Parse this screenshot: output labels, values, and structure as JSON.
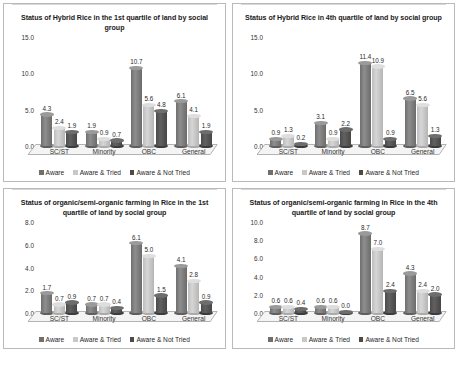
{
  "caption": "",
  "legend": {
    "items": [
      {
        "label": "Aware",
        "color": "#6f6f6f",
        "swatch_class": "sw0"
      },
      {
        "label": "Aware & Tried",
        "color": "#c8c8c8",
        "swatch_class": "sw1"
      },
      {
        "label": "Aware & Not Tried",
        "color": "#4b4b4b",
        "swatch_class": "sw2"
      }
    ]
  },
  "chart_data": [
    {
      "id": "hybrid-rice-1st-quartile",
      "type": "bar",
      "title": "Status of Hybrid Rice in the 1st quartile of land by social group",
      "xlabel": "",
      "ylabel": "",
      "ylim": [
        0,
        15
      ],
      "yticks": [
        "0.0",
        "5.0",
        "10.0",
        "15.0"
      ],
      "grid": false,
      "legend_position": "bottom",
      "categories": [
        "SC/ST",
        "Minority",
        "OBC",
        "General"
      ],
      "series": [
        {
          "name": "Aware",
          "values": [
            4.3,
            1.9,
            10.7,
            6.1
          ]
        },
        {
          "name": "Aware & Tried",
          "values": [
            2.4,
            0.9,
            5.6,
            4.1
          ]
        },
        {
          "name": "Aware & Not Tried",
          "values": [
            1.9,
            0.7,
            4.8,
            1.9
          ]
        }
      ]
    },
    {
      "id": "hybrid-rice-4th-quartile",
      "type": "bar",
      "title": "Status of Hybrid Rice in 4th quartile of land by social group",
      "xlabel": "",
      "ylabel": "",
      "ylim": [
        0,
        15
      ],
      "yticks": [
        "0.0",
        "5.0",
        "10.0",
        "15.0"
      ],
      "grid": false,
      "legend_position": "bottom",
      "categories": [
        "SC/ST",
        "Minority",
        "OBC",
        "General"
      ],
      "series": [
        {
          "name": "Aware",
          "values": [
            0.9,
            3.1,
            11.4,
            6.5
          ]
        },
        {
          "name": "Aware & Tried",
          "values": [
            1.3,
            0.9,
            10.9,
            5.6
          ]
        },
        {
          "name": "Aware & Not Tried",
          "values": [
            0.2,
            2.2,
            0.9,
            1.3
          ]
        }
      ]
    },
    {
      "id": "organic-farming-1st-quartile",
      "type": "bar",
      "title": "Status of organic/semi-organic farming in Rice in the 1st quartile of land by social group",
      "xlabel": "",
      "ylabel": "",
      "ylim": [
        0,
        8
      ],
      "yticks": [
        "0.0",
        "2.0",
        "4.0",
        "6.0",
        "8.0"
      ],
      "grid": false,
      "legend_position": "bottom",
      "categories": [
        "SC/ST",
        "Minority",
        "OBC",
        "General"
      ],
      "series": [
        {
          "name": "Aware",
          "values": [
            1.7,
            0.7,
            6.1,
            4.1
          ]
        },
        {
          "name": "Aware & Tried",
          "values": [
            0.7,
            0.7,
            5.0,
            2.8
          ]
        },
        {
          "name": "Aware & Not Tried",
          "values": [
            0.9,
            0.4,
            1.5,
            0.9
          ]
        }
      ]
    },
    {
      "id": "organic-farming-4th-quartile",
      "type": "bar",
      "title": "Status of organic/semi-organic farming in Rice in the 4th quartile of land by social group",
      "xlabel": "",
      "ylabel": "",
      "ylim": [
        0,
        10
      ],
      "yticks": [
        "0.0",
        "2.0",
        "4.0",
        "6.0",
        "8.0",
        "10.0"
      ],
      "grid": false,
      "legend_position": "bottom",
      "categories": [
        "SC/ST",
        "Minority",
        "OBC",
        "General"
      ],
      "series": [
        {
          "name": "Aware",
          "values": [
            0.6,
            0.6,
            8.7,
            4.3
          ]
        },
        {
          "name": "Aware & Tried",
          "values": [
            0.6,
            0.6,
            7.0,
            2.4
          ]
        },
        {
          "name": "Aware & Not Tried",
          "values": [
            0.4,
            0.0,
            2.4,
            2.0
          ]
        }
      ]
    }
  ]
}
